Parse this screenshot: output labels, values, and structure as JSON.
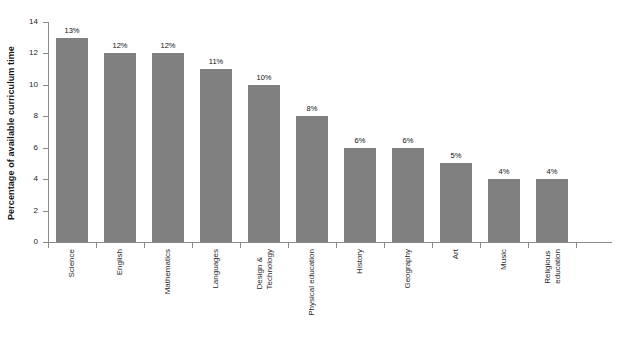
{
  "chart_data": {
    "type": "bar",
    "title": "",
    "xlabel": "",
    "ylabel": "Percentage of available curriculum time",
    "ylim": [
      0,
      14
    ],
    "ytick_step": 2,
    "yticks": [
      "0",
      "2",
      "4",
      "6",
      "8",
      "10",
      "12",
      "14"
    ],
    "grid": false,
    "legend": "none",
    "bar_color": "#808080",
    "axis_color": "#8a8a8a",
    "background": "#ffffff",
    "categories": [
      "Science",
      "English",
      "Mathematics",
      "Languages",
      "Design & Technology",
      "Physical education",
      "History",
      "Geography",
      "Art",
      "Music",
      "Religious education"
    ],
    "category_lines": [
      [
        "Science"
      ],
      [
        "English"
      ],
      [
        "Mathematics"
      ],
      [
        "Languages"
      ],
      [
        "Design &",
        "Technology"
      ],
      [
        "Physical education"
      ],
      [
        "History"
      ],
      [
        "Geography"
      ],
      [
        "Art"
      ],
      [
        "Music"
      ],
      [
        "Religious",
        "education"
      ]
    ],
    "values": [
      13,
      12,
      12,
      11,
      10,
      8,
      6,
      6,
      5,
      4,
      4
    ],
    "data_labels": [
      "13%",
      "12%",
      "12%",
      "11%",
      "10%",
      "8%",
      "6%",
      "6%",
      "5%",
      "4%",
      "4%"
    ]
  }
}
